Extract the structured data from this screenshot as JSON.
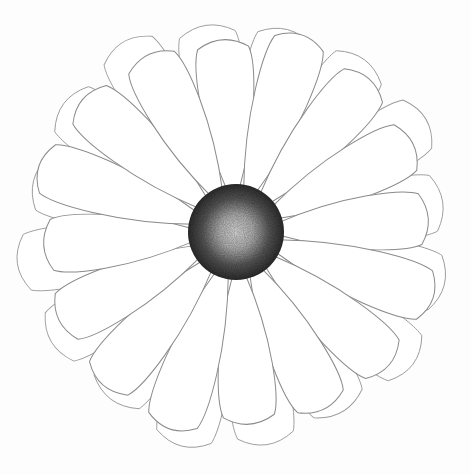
{
  "image": {
    "subject": "pencil-sketch flower",
    "width": 471,
    "height": 475,
    "background_color": "#fdfdfd",
    "line_color": "#8a8a8a",
    "center": {
      "cx": 236,
      "cy": 232,
      "r": 48,
      "outer_color": "#3a3a3a",
      "inner_color": "#d8d8d8"
    },
    "front_petal_count": 16,
    "back_petal_count": 16
  }
}
